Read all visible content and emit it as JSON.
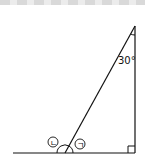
{
  "diagram": {
    "angle_label": "30°",
    "angle_marks": [
      "ㄴ",
      "ㄱ"
    ],
    "right_angle": true,
    "colors": {
      "stroke": "#111111",
      "background": "#ffffff"
    }
  }
}
